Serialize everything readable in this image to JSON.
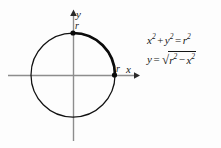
{
  "figure": {
    "background_color": "#fdfdfd",
    "axis_color": "#8d8d8d",
    "curve_color": "#111111"
  },
  "axes": {
    "x_label": "x",
    "y_label": "y",
    "origin": {
      "x": 73,
      "y": 75
    },
    "x_axis": {
      "start_x": 8,
      "end_x": 137,
      "y": 75
    },
    "y_axis": {
      "x": 73,
      "start_y": 12,
      "end_y": 141
    }
  },
  "points": [
    {
      "name": "top-point",
      "label": "r",
      "x": 73,
      "y": 33,
      "axis": "y-intercept"
    },
    {
      "name": "right-point",
      "label": "r",
      "x": 114,
      "y": 75,
      "axis": "x-intercept"
    }
  ],
  "circle": {
    "center_x": 73,
    "center_y": 75,
    "radius": 42,
    "highlighted_arc": "first quadrant, from (0, r) to (r, 0)"
  },
  "equations": {
    "circle": {
      "lhs_first": "x",
      "lhs_first_exp": "2",
      "plus": "+",
      "lhs_second": "y",
      "lhs_second_exp": "2",
      "equals": "=",
      "rhs": "r",
      "rhs_exp": "2",
      "plain": "x² + y² = r²"
    },
    "solved": {
      "lhs": "y",
      "equals": "=",
      "radical_sign": "√",
      "radicand_first": "r",
      "radicand_first_exp": "2",
      "minus": "−",
      "radicand_second": "x",
      "radicand_second_exp": "2",
      "plain": "y = √(r² − x²)"
    }
  }
}
